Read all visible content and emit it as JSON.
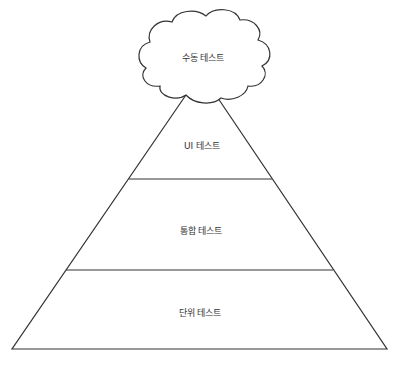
{
  "diagram": {
    "cloud": {
      "label": "수동 테스트"
    },
    "layers": [
      {
        "label": "UI 테스트"
      },
      {
        "label": "통합 테스트"
      },
      {
        "label": "단위 테스트"
      }
    ],
    "colors": {
      "stroke": "#333333",
      "fill": "#ffffff",
      "text": "#333333"
    }
  }
}
